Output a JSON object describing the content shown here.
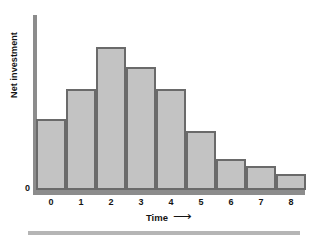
{
  "figure": {
    "bottom_rule_name": "bottom-divider-rule"
  },
  "chart_data": {
    "type": "bar",
    "title": "",
    "subtitle": "",
    "xlabel": "Time",
    "xlabel_arrow": "⟶",
    "ylabel": "Net investment",
    "categories": [
      "0",
      "1",
      "2",
      "3",
      "4",
      "5",
      "6",
      "7",
      "8"
    ],
    "values": [
      50,
      71,
      100,
      86,
      71,
      41,
      22,
      17,
      11
    ],
    "ytick_labels": [
      "0"
    ],
    "ylim": [
      0,
      133
    ],
    "xlim_labels": [
      "0",
      "8"
    ],
    "grid": false,
    "legend": null,
    "annotations": [],
    "bar_fill_color": "#c3c3c3",
    "bar_border_color": "#6a6a6a",
    "axis_color": "#8c8c8c",
    "text_color": "#141414"
  }
}
